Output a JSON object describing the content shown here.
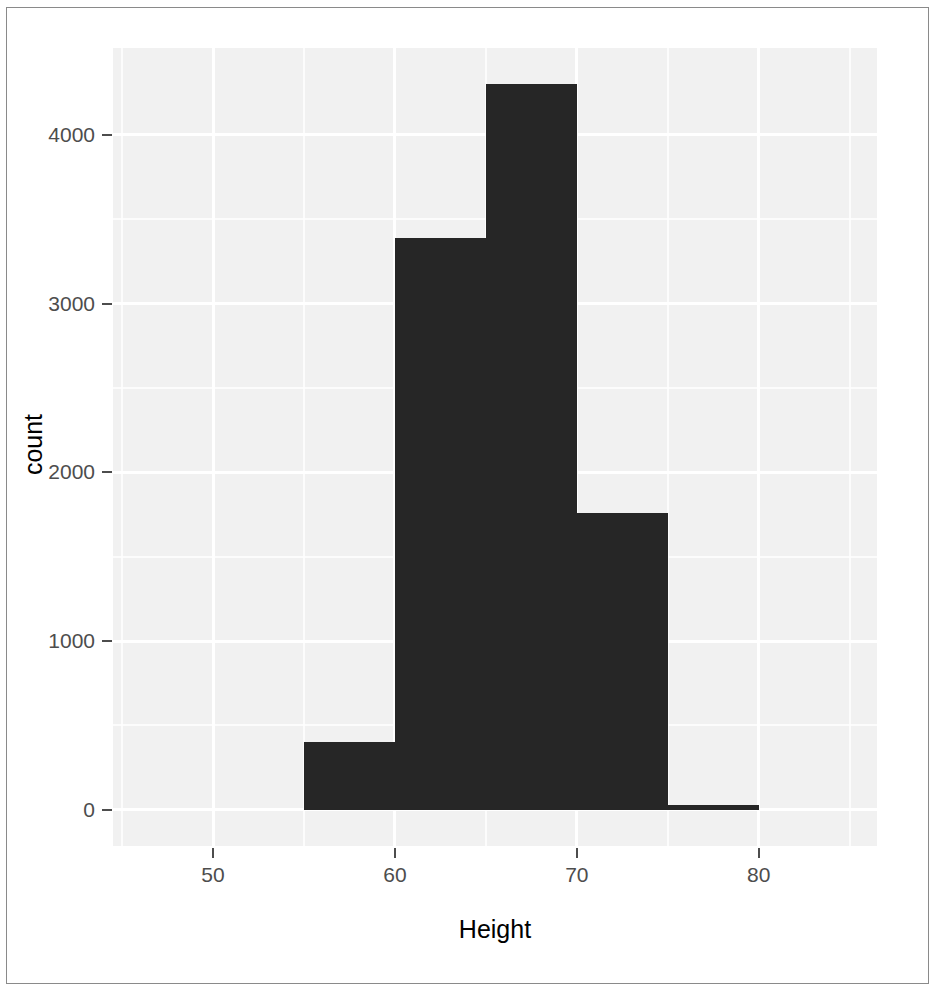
{
  "chart_data": {
    "type": "bar",
    "subtype": "histogram",
    "title": "",
    "subtitle": "",
    "xlabel": "Height",
    "ylabel": "count",
    "xlim": [
      44.5,
      86.5
    ],
    "ylim": [
      -215,
      4515
    ],
    "binwidth": 5,
    "grid": true,
    "legend": null,
    "x_ticks": [
      50,
      60,
      70,
      80
    ],
    "x_tick_labels": [
      "50",
      "60",
      "70",
      "80"
    ],
    "y_ticks": [
      0,
      1000,
      2000,
      3000,
      4000
    ],
    "y_tick_labels": [
      "0",
      "1000",
      "2000",
      "3000",
      "4000"
    ],
    "x_minor_ticks": [
      45,
      55,
      65,
      75,
      85
    ],
    "y_minor_ticks": [
      500,
      1500,
      2500,
      3500
    ],
    "bins": [
      {
        "x_start": 55,
        "x_end": 60,
        "label": "55-60",
        "value": 400
      },
      {
        "x_start": 60,
        "x_end": 65,
        "label": "60-65",
        "value": 3390
      },
      {
        "x_start": 65,
        "x_end": 70,
        "label": "65-70",
        "value": 4300
      },
      {
        "x_start": 70,
        "x_end": 75,
        "label": "70-75",
        "value": 1760
      },
      {
        "x_start": 75,
        "x_end": 80,
        "label": "75-80",
        "value": 30
      }
    ],
    "categories": [
      "55-60",
      "60-65",
      "65-70",
      "70-75",
      "75-80"
    ],
    "values": [
      400,
      3390,
      4300,
      1760,
      30
    ],
    "colors": {
      "bar_fill": "#262626",
      "panel_background": "#f1f1f1",
      "gridline": "#ffffff",
      "axis_text": "#4d4d4d",
      "axis_title": "#000000",
      "figure_border": "#8a8a8a",
      "figure_background": "#ffffff"
    }
  }
}
